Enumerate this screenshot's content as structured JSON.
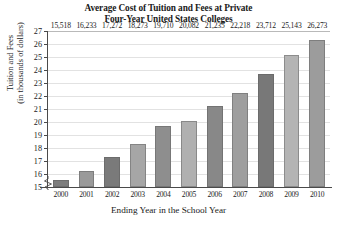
{
  "chart_data": {
    "type": "bar",
    "title": "Average Cost of Tuition and Fees at Private Four-Year United States Colleges",
    "title_lines": [
      "Average Cost of Tuition and Fees at Private",
      "Four-Year United States Colleges"
    ],
    "xlabel": "Ending Year in the School Year",
    "ylabel": "Tuition and Fees (in thousands of dollars)",
    "ylabel_lines": [
      "Tuition and Fees",
      "(in thousands of dollars)"
    ],
    "categories": [
      "2000",
      "2001",
      "2002",
      "2003",
      "2004",
      "2005",
      "2006",
      "2007",
      "2008",
      "2009",
      "2010"
    ],
    "values": [
      15518,
      16233,
      17272,
      18273,
      19710,
      20082,
      21235,
      22218,
      23712,
      25143,
      26273
    ],
    "value_labels": [
      "15,518",
      "16,233",
      "17,272",
      "18,273",
      "19,710",
      "20,082",
      "21,235",
      "22,218",
      "23,712",
      "25,143",
      "26,273"
    ],
    "ylim": [
      15,
      27
    ],
    "ytick_labels": [
      "27",
      "26",
      "25",
      "24",
      "23",
      "22",
      "21",
      "20",
      "19",
      "18",
      "17",
      "16",
      "15"
    ],
    "ytick_values": [
      27,
      26,
      25,
      24,
      23,
      22,
      21,
      20,
      19,
      18,
      17,
      16,
      15
    ],
    "y_unit": "thousands of dollars",
    "grid": true,
    "legend": "none",
    "axis_break": true,
    "bar_colors": [
      "#7d7d7d",
      "#9a9a9a",
      "#7a7a7a",
      "#a6a6a6",
      "#8e8e8e",
      "#b0b0b0",
      "#888888",
      "#9e9e9e",
      "#787878",
      "#b4b4b4",
      "#9c9c9c"
    ],
    "axis_color": "#4a4a4a",
    "grid_color": "#e2e2e2"
  }
}
